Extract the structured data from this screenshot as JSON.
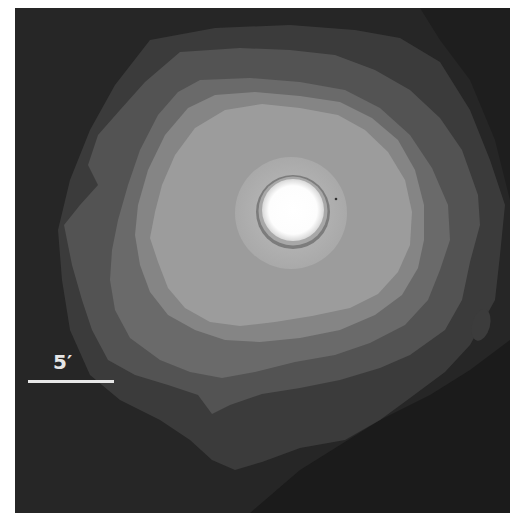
{
  "figure": {
    "scale_bar": {
      "label": "5′",
      "length_px": 86
    },
    "colors": {
      "frame_background": "#252525",
      "outer_background_dark": "#1c1c1c",
      "level_1": "#3b3b3b",
      "level_2": "#535353",
      "level_3": "#6a6a6a",
      "level_4": "#858585",
      "level_5": "#9c9c9c",
      "inner_ring": "#b7b7b7",
      "core_ring": "#7a7a7a",
      "core": "#ffffff"
    },
    "core_center_px": [
      293,
      212
    ]
  }
}
